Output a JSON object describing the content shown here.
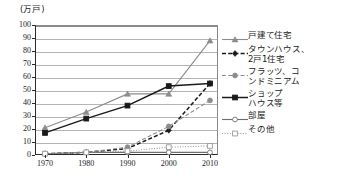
{
  "chart_data": {
    "type": "line",
    "title": "",
    "subtitle": "",
    "xlabel": "",
    "ylabel": "(万戸)",
    "unit_label": "(万戸)",
    "x": [
      1970,
      1980,
      1990,
      2000,
      2010
    ],
    "categories": [
      "1970",
      "1980",
      "1990",
      "2000",
      "2010"
    ],
    "xlim": [
      1965,
      2015
    ],
    "ylim": [
      0,
      100
    ],
    "yticks": [
      0,
      10,
      20,
      30,
      40,
      50,
      60,
      70,
      80,
      90,
      100
    ],
    "ytick_labels": [
      "0",
      "10",
      "20",
      "30",
      "40",
      "50",
      "60",
      "70",
      "80",
      "90",
      "100"
    ],
    "grid": true,
    "grid_axis": "y",
    "legend_position": "right",
    "series": [
      {
        "name": "戸建て住宅",
        "legend_label": "戸建て住宅",
        "values": [
          21,
          33,
          47,
          47,
          88
        ],
        "color": "#8c8c8c",
        "marker": "triangle",
        "marker_fill": "#8c8c8c",
        "line_style": "solid"
      },
      {
        "name": "タウンハウス、2戸1住宅",
        "legend_label": "タウンハウス、\n2戸1住宅",
        "values": [
          1,
          2,
          5,
          19,
          55
        ],
        "color": "#1a1a1a",
        "marker": "diamond",
        "marker_fill": "#1a1a1a",
        "line_style": "dashed"
      },
      {
        "name": "フラッツ、コンドミニアム",
        "legend_label": "フラッツ、コ\nンドミニアム",
        "values": [
          1,
          2,
          6,
          22,
          42
        ],
        "color": "#8c8c8c",
        "marker": "circle",
        "marker_fill": "#8c8c8c",
        "line_style": "dashed"
      },
      {
        "name": "ショップハウス等",
        "legend_label": "ショップ\nハウス等",
        "values": [
          17,
          28,
          38,
          53,
          55
        ],
        "color": "#1a1a1a",
        "marker": "square",
        "marker_fill": "#1a1a1a",
        "line_style": "solid"
      },
      {
        "name": "部屋",
        "legend_label": "部屋",
        "values": [
          1,
          2,
          2,
          2,
          2
        ],
        "color": "#6e6e6e",
        "marker": "circle-open",
        "marker_fill": "#ffffff",
        "line_style": "solid"
      },
      {
        "name": "その他",
        "legend_label": "その他",
        "values": [
          1,
          2,
          3,
          6,
          7
        ],
        "color": "#9a9a9a",
        "marker": "square-open",
        "marker_fill": "#ffffff",
        "line_style": "dotted"
      }
    ]
  }
}
